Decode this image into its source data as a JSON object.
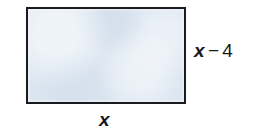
{
  "figure": {
    "type": "rectangle-diagram",
    "background_color": "#ffffff",
    "shape": {
      "name": "rectangle",
      "fill_color": "#dce6f1",
      "stroke_color": "#1b1b1f",
      "stroke_width_px": 2,
      "x_px": 26,
      "y_px": 7,
      "width_px": 160,
      "height_px": 97
    },
    "labels": {
      "height": {
        "full_text": "x − 4",
        "variable": "x",
        "operator": "−",
        "number": "4",
        "position": "right-of-rectangle",
        "color": "#17171a"
      },
      "width": {
        "full_text": "x",
        "variable": "x",
        "position": "below-rectangle",
        "color": "#17171a"
      }
    }
  }
}
